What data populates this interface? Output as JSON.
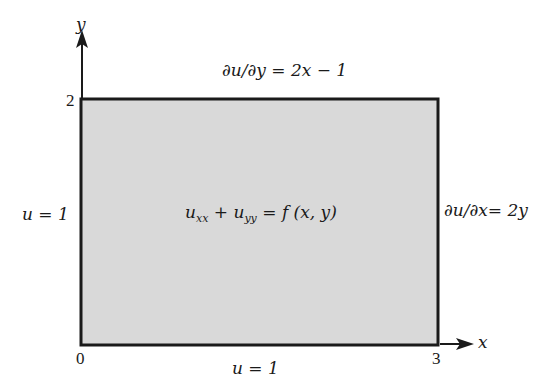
{
  "diagram": {
    "type": "boundary-value-problem-domain",
    "axes": {
      "x_label": "x",
      "y_label": "y"
    },
    "ticks": {
      "origin": "0",
      "x_max": "3",
      "y_max": "2"
    },
    "domain": {
      "x_range": [
        0,
        3
      ],
      "y_range": [
        0,
        2
      ],
      "fill_color": "#d9d9d9",
      "border_color": "#1a1a1a"
    },
    "pde": {
      "term1_base": "u",
      "term1_sub": "xx",
      "plus": "+",
      "term2_base": "u",
      "term2_sub": "yy",
      "rhs": "= f (x, y)"
    },
    "boundaries": {
      "top": "∂u/∂y = 2x − 1",
      "right": "∂u/∂x= 2y",
      "left": "u = 1",
      "bottom": "u = 1"
    }
  }
}
